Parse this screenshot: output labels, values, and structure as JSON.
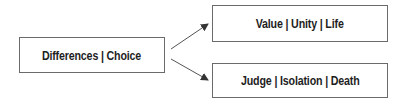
{
  "diagram": {
    "source": {
      "label": "Differences | Choice"
    },
    "targets": [
      {
        "label": "Value | Unity | Life"
      },
      {
        "label": "Judge | Isolation | Death"
      }
    ],
    "edges": [
      {
        "from": "Differences | Choice",
        "to": "Value | Unity | Life"
      },
      {
        "from": "Differences | Choice",
        "to": "Judge | Isolation | Death"
      }
    ],
    "colors": {
      "border": "#6a6a6a",
      "text": "#1e1e1e",
      "arrow": "#444444"
    }
  }
}
